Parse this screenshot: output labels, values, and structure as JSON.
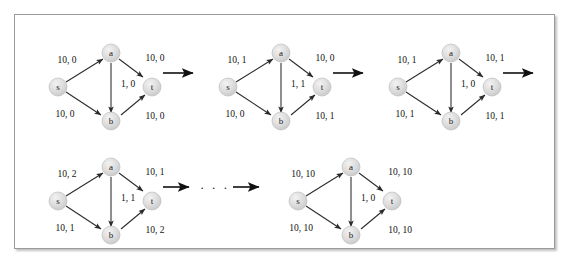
{
  "figure": {
    "title": "",
    "node_labels": {
      "s": "s",
      "a": "a",
      "b": "b",
      "t": "t"
    },
    "colors": {
      "node_fill": "#dcdcdc",
      "node_stroke": "#bdbdbd",
      "edge": "#2a2a2a",
      "text": "#111111",
      "frame": "#9a9a9a",
      "background": "#ffffff"
    },
    "ellipsis": "· · ·",
    "graphs": [
      {
        "id": "step-1",
        "edges": {
          "s_a": "10, 0",
          "a_t": "10, 0",
          "a_b": "1, 0",
          "s_b": "10, 0",
          "b_t": "10, 0"
        }
      },
      {
        "id": "step-2",
        "edges": {
          "s_a": "10, 1",
          "a_t": "10, 0",
          "a_b": "1, 1",
          "s_b": "10, 0",
          "b_t": "10, 1"
        }
      },
      {
        "id": "step-3",
        "edges": {
          "s_a": "10, 1",
          "a_t": "10, 1",
          "a_b": "1, 0",
          "s_b": "10, 1",
          "b_t": "10, 1"
        }
      },
      {
        "id": "step-4",
        "edges": {
          "s_a": "10, 2",
          "a_t": "10, 1",
          "a_b": "1, 1",
          "s_b": "10, 1",
          "b_t": "10, 2"
        }
      },
      {
        "id": "step-5",
        "edges": {
          "s_a": "10, 10",
          "a_t": "10, 10",
          "a_b": "1, 0",
          "s_b": "10, 10",
          "b_t": "10, 10"
        }
      }
    ]
  }
}
